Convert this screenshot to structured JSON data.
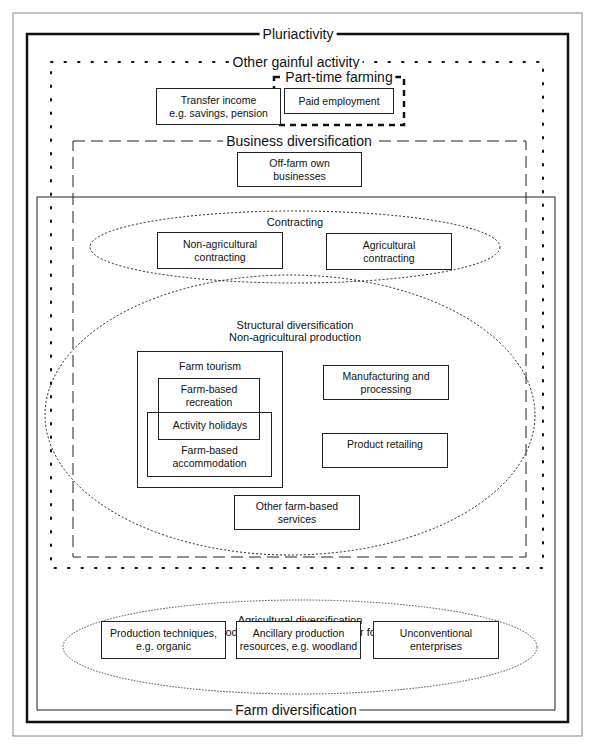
{
  "diagram": {
    "frames": {
      "pluriactivity": "Pluriactivity",
      "other_gainful_activity": "Other gainful activity",
      "part_time_farming": "Part-time farming",
      "business_diversification": "Business diversification",
      "farm_diversification": "Farm diversification"
    },
    "boxes": {
      "transfer_income": [
        "Transfer income",
        "e.g. savings, pension"
      ],
      "paid_employment": [
        "Paid employment"
      ],
      "off_farm_businesses": [
        "Off-farm own",
        "businesses"
      ],
      "non_agri_contracting": [
        "Non-agricultural",
        "contracting"
      ],
      "agri_contracting": [
        "Agricultural",
        "contracting"
      ],
      "farm_tourism": "Farm tourism",
      "farm_based_recreation": [
        "Farm-based",
        "recreation"
      ],
      "activity_holidays": "Activity holidays",
      "farm_based_accommodation": [
        "Farm-based",
        "accommodation"
      ],
      "manufacturing": [
        "Manufacturing and",
        "processing"
      ],
      "product_retailing": [
        "Product retailing"
      ],
      "other_farm_services": [
        "Other farm-based",
        "services"
      ],
      "production_techniques": [
        "Production techniques,",
        "e.g. organic"
      ],
      "ancillary_resources": [
        "Ancillary production",
        "resources, e.g. woodland"
      ],
      "unconventional": [
        "Unconventional",
        "enterprises"
      ]
    },
    "ellipses": {
      "contracting": "Contracting",
      "structural": [
        "Structural diversification",
        "Non-agricultural production"
      ],
      "agricultural": [
        "Agricultural diversification",
        "Agricultural production of raw materials for food or industry"
      ]
    }
  }
}
